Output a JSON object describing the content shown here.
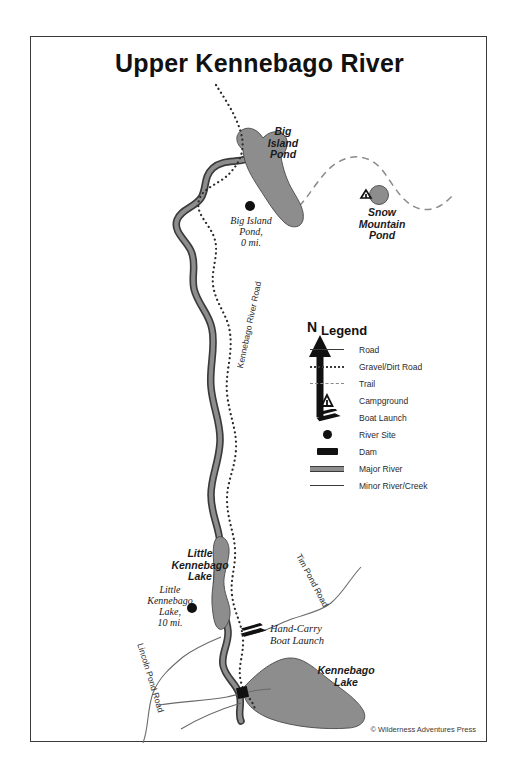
{
  "title": "Upper Kennebago River",
  "credit": "© Wilderness Adventures Press",
  "legend": {
    "heading": "Legend",
    "north_label": "N",
    "items": [
      {
        "symbol": "road",
        "label": "Road"
      },
      {
        "symbol": "gravel-road",
        "label": "Gravel/Dirt Road"
      },
      {
        "symbol": "trail",
        "label": "Trail"
      },
      {
        "symbol": "campground",
        "label": "Campground"
      },
      {
        "symbol": "boat-launch",
        "label": "Boat Launch"
      },
      {
        "symbol": "river-site",
        "label": "River Site"
      },
      {
        "symbol": "dam",
        "label": "Dam"
      },
      {
        "symbol": "major-river",
        "label": "Major River"
      },
      {
        "symbol": "minor-river",
        "label": "Minor River/Creek"
      }
    ]
  },
  "water_bodies": [
    {
      "name": "Big Island Pond",
      "label_lines": [
        "Big",
        "Island",
        "Pond"
      ]
    },
    {
      "name": "Snow Mountain Pond",
      "label_lines": [
        "Snow",
        "Mountain",
        "Pond"
      ]
    },
    {
      "name": "Little Kennebago Lake",
      "label_lines": [
        "Little",
        "Kennebago",
        "Lake"
      ]
    },
    {
      "name": "Kennebago Lake",
      "label_lines": [
        "Kennebago",
        "Lake"
      ]
    }
  ],
  "river_sites": [
    {
      "name": "Big Island Pond",
      "lines": [
        "Big Island",
        "Pond,",
        "0 mi."
      ],
      "mileage": "0 mi."
    },
    {
      "name": "Little Kennebago Lake",
      "lines": [
        "Little",
        "Kennebago",
        "Lake,",
        "10 mi."
      ],
      "mileage": "10 mi."
    }
  ],
  "facilities": [
    {
      "type": "boat-launch",
      "lines": [
        "Hand-Carry",
        "Boat Launch"
      ]
    }
  ],
  "roads": [
    {
      "name": "Kennebago River Road"
    },
    {
      "name": "Tim Pond Road"
    },
    {
      "name": "Lincoln Pond Road"
    }
  ],
  "colors": {
    "water": "#8d8d8d",
    "water_outline": "#4a4a4a",
    "river_fill": "#8d8d8d",
    "river_edge": "#3a3a3a",
    "road": "#3a3a3a",
    "trail": "#8a8a8a",
    "ink": "#1a1a1a",
    "frame": "#3a3a3a",
    "paper": "#ffffff"
  }
}
